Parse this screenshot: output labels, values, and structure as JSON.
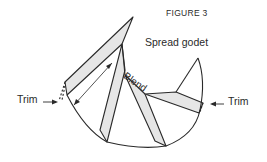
{
  "figure": {
    "title": "FIGURE 3",
    "caption": "Spread godet",
    "labels": {
      "trim_left": "Trim",
      "trim_right": "Trim",
      "blend": "Blend"
    }
  },
  "colors": {
    "line": "#2a2a2a",
    "fill": "#e6e6e6",
    "background": "#ffffff"
  }
}
